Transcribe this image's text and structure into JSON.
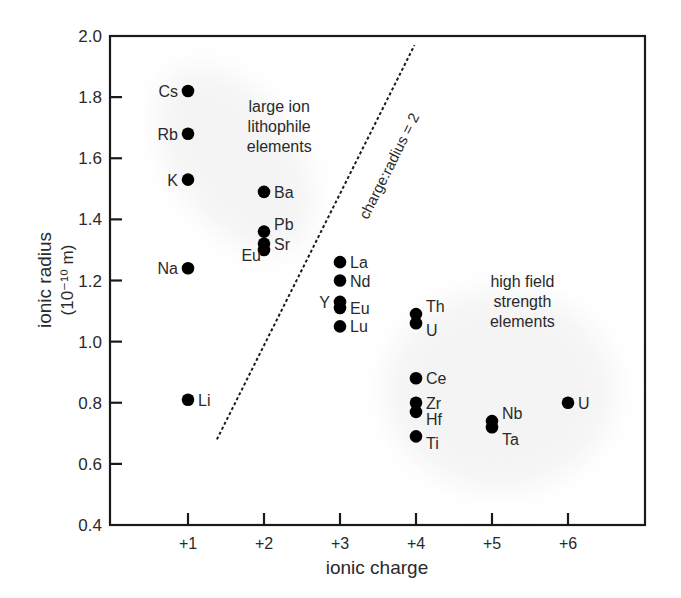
{
  "chart_data": {
    "type": "scatter",
    "title": "",
    "xlabel": "ionic charge",
    "ylabel": "ionic radius",
    "ylabel_units": "(10⁻¹⁰ m)",
    "xlim": [
      0,
      7
    ],
    "ylim": [
      0.4,
      2.0
    ],
    "x_ticks": [
      1,
      2,
      3,
      4,
      5,
      6
    ],
    "x_tick_labels": [
      "+1",
      "+2",
      "+3",
      "+4",
      "+5",
      "+6"
    ],
    "y_ticks": [
      0.4,
      0.6,
      0.8,
      1.0,
      1.2,
      1.4,
      1.6,
      1.8,
      2.0
    ],
    "y_tick_labels": [
      "0.4",
      "0.6",
      "0.8",
      "1.0",
      "1.2",
      "1.4",
      "1.6",
      "1.8",
      "2.0"
    ],
    "grid": false,
    "legend": null,
    "points": [
      {
        "label": "Cs",
        "x": 1,
        "y": 1.82,
        "label_side": "left"
      },
      {
        "label": "Rb",
        "x": 1,
        "y": 1.68,
        "label_side": "left"
      },
      {
        "label": "K",
        "x": 1,
        "y": 1.53,
        "label_side": "left"
      },
      {
        "label": "Na",
        "x": 1,
        "y": 1.24,
        "label_side": "left"
      },
      {
        "label": "Li",
        "x": 1,
        "y": 0.81,
        "label_side": "right"
      },
      {
        "label": "Ba",
        "x": 2,
        "y": 1.49,
        "label_side": "right"
      },
      {
        "label": "Pb",
        "x": 2,
        "y": 1.36,
        "label_side": "right-up"
      },
      {
        "label": "Sr",
        "x": 2,
        "y": 1.32,
        "label_side": "right"
      },
      {
        "label": "Eu",
        "x": 2,
        "y": 1.3,
        "label_side": "left-down"
      },
      {
        "label": "La",
        "x": 3,
        "y": 1.26,
        "label_side": "right"
      },
      {
        "label": "Nd",
        "x": 3,
        "y": 1.2,
        "label_side": "right"
      },
      {
        "label": "Y",
        "x": 3,
        "y": 1.13,
        "label_side": "left"
      },
      {
        "label": "Eu",
        "x": 3,
        "y": 1.11,
        "label_side": "right"
      },
      {
        "label": "Lu",
        "x": 3,
        "y": 1.05,
        "label_side": "right"
      },
      {
        "label": "Th",
        "x": 4,
        "y": 1.09,
        "label_side": "right-up"
      },
      {
        "label": "U",
        "x": 4,
        "y": 1.06,
        "label_side": "right-down"
      },
      {
        "label": "Ce",
        "x": 4,
        "y": 0.88,
        "label_side": "right"
      },
      {
        "label": "Zr",
        "x": 4,
        "y": 0.8,
        "label_side": "right"
      },
      {
        "label": "Hf",
        "x": 4,
        "y": 0.77,
        "label_side": "right-down"
      },
      {
        "label": "Ti",
        "x": 4,
        "y": 0.69,
        "label_side": "right-down"
      },
      {
        "label": "Nb",
        "x": 5,
        "y": 0.74,
        "label_side": "right-up"
      },
      {
        "label": "Ta",
        "x": 5,
        "y": 0.72,
        "label_side": "right-down"
      },
      {
        "label": "U",
        "x": 6,
        "y": 0.8,
        "label_side": "right"
      }
    ],
    "reference_line": {
      "label": "charge:radius = 2",
      "style": "dotted",
      "from": {
        "x": 1.38,
        "y": 0.68
      },
      "to": {
        "x": 3.98,
        "y": 1.97
      }
    },
    "annotations": [
      {
        "text": [
          "large ion",
          "lithophile",
          "elements"
        ],
        "x": 2.2,
        "y": 1.75
      },
      {
        "text": [
          "high field",
          "strength",
          "elements"
        ],
        "x": 5.4,
        "y": 1.18
      }
    ],
    "regions": [
      {
        "name": "large ion lithophile elements",
        "shading": "light gray"
      },
      {
        "name": "high field strength elements",
        "shading": "light gray"
      }
    ]
  },
  "colors": {
    "axis": "#1a1a1a",
    "points": "#000000",
    "text": "#2a2a2a",
    "region_fill": "#f4f4f4"
  }
}
